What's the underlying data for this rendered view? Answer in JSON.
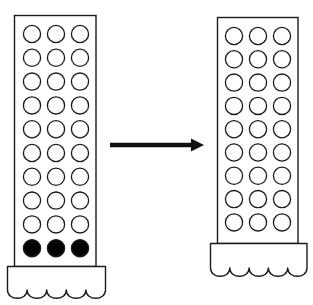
{
  "diagram": {
    "type": "before-after transformation",
    "colors": {
      "stroke": "#1a1a1a",
      "filled_circle": "#000000",
      "empty_circle": "#ffffff",
      "background": "#ffffff",
      "arrow": "#111111"
    },
    "columns_per_row": 3,
    "before": {
      "label": "",
      "rows_empty": 9,
      "rows_filled": 1,
      "filled_position": "bottom",
      "total_rows": 10
    },
    "arrow": {
      "direction": "right",
      "label": ""
    },
    "after": {
      "label": "",
      "rows_empty": 9,
      "rows_filled": 0,
      "total_rows": 9
    }
  }
}
